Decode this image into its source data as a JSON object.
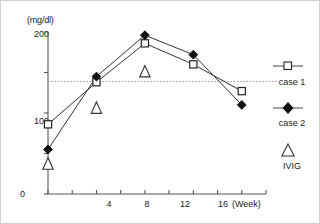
{
  "chart_data": {
    "type": "line",
    "title": "",
    "subtitle": "",
    "ylabel": "(mg/dl)",
    "xlabel": "(Week)",
    "x": [
      0,
      4,
      8,
      12,
      16
    ],
    "xlim": [
      0,
      18
    ],
    "ylim": [
      0,
      200
    ],
    "y_ticks": [
      0,
      100,
      200
    ],
    "y_tick_labels": [
      "0",
      "100",
      "200"
    ],
    "x_ticks": [
      0,
      2,
      4,
      6,
      8,
      10,
      12,
      14,
      16,
      18
    ],
    "x_tick_labels": [
      "",
      "",
      "4",
      "",
      "8",
      "",
      "12",
      "",
      "16",
      ""
    ],
    "x_labeled_ticks": [
      4,
      8,
      12,
      16
    ],
    "grid": false,
    "legend_position": "right",
    "reference_line": {
      "type": "horizontal-dotted",
      "value": 139,
      "label": ""
    },
    "series": [
      {
        "name": "case 1",
        "marker": "open-square",
        "values": [
          86,
          138,
          186,
          160,
          127
        ]
      },
      {
        "name": "case 2",
        "marker": "filled-diamond",
        "values": [
          55,
          145,
          196,
          172,
          110
        ]
      },
      {
        "name": "IVIG",
        "marker": "open-triangle",
        "x": [
          0,
          4,
          8
        ],
        "values": [
          36,
          105,
          150
        ]
      }
    ]
  },
  "axes": {
    "y_unit_label": "(mg/dl)",
    "y_tick_200": "200",
    "y_tick_100": "100",
    "y_tick_0": "0",
    "x_tick_4": "4",
    "x_tick_8": "8",
    "x_tick_12": "12",
    "x_tick_16": "16",
    "x_axis_name": "(Week)"
  },
  "legend": {
    "items": [
      {
        "label": "case 1",
        "marker": "open-square"
      },
      {
        "label": "case 2",
        "marker": "filled-diamond"
      },
      {
        "label": "IVIG",
        "marker": "open-triangle"
      }
    ]
  }
}
